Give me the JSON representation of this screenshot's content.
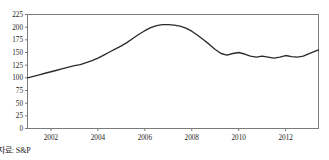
{
  "caption": {
    "source_text": "자료: S&P"
  },
  "chart_data": {
    "type": "line",
    "title": "",
    "subtitle": "",
    "xlabel": "",
    "ylabel": "",
    "grid": false,
    "legend": null,
    "frame": true,
    "line_color": "#2b2b2b",
    "axis_color": "#7a7a7a",
    "ylim": [
      0,
      225
    ],
    "yticks": [
      0,
      25,
      50,
      75,
      100,
      125,
      150,
      175,
      200,
      225
    ],
    "ytick_labels": [
      "0",
      "25",
      "50",
      "75",
      "100",
      "125",
      "150",
      "175",
      "200",
      "225"
    ],
    "xlim": [
      2001.0,
      2013.4
    ],
    "xticks": [
      2002,
      2004,
      2006,
      2008,
      2010,
      2012
    ],
    "xtick_labels": [
      "2002",
      "2004",
      "2006",
      "2008",
      "2010",
      "2012"
    ],
    "x": [
      2001.0,
      2001.25,
      2001.5,
      2001.75,
      2002.0,
      2002.25,
      2002.5,
      2002.75,
      2003.0,
      2003.25,
      2003.5,
      2003.75,
      2004.0,
      2004.25,
      2004.5,
      2004.75,
      2005.0,
      2005.25,
      2005.5,
      2005.75,
      2006.0,
      2006.25,
      2006.5,
      2006.75,
      2007.0,
      2007.25,
      2007.5,
      2007.75,
      2008.0,
      2008.25,
      2008.5,
      2008.75,
      2009.0,
      2009.25,
      2009.5,
      2009.75,
      2010.0,
      2010.25,
      2010.5,
      2010.75,
      2011.0,
      2011.25,
      2011.5,
      2011.75,
      2012.0,
      2012.25,
      2012.5,
      2012.75,
      2013.0,
      2013.4
    ],
    "values": [
      100,
      103,
      106,
      109,
      112,
      115,
      118,
      121,
      124,
      126,
      130,
      134,
      139,
      145,
      151,
      157,
      163,
      170,
      178,
      186,
      193,
      199,
      203,
      205,
      205,
      204,
      202,
      198,
      192,
      184,
      175,
      166,
      156,
      148,
      145,
      148,
      150,
      147,
      143,
      141,
      143,
      141,
      139,
      141,
      144,
      142,
      141,
      143,
      148,
      155
    ],
    "annotations": []
  }
}
